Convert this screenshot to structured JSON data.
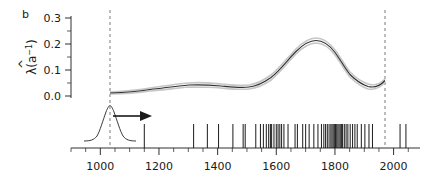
{
  "panel": {
    "label": "b"
  },
  "axes": {
    "y": {
      "label_main": "λ",
      "label_hat": "^",
      "label_paren_open": "(a",
      "label_sup": "−1",
      "label_paren_close": ")",
      "ticks": [
        "0.0",
        "0.1",
        "0.2",
        "0.3"
      ],
      "tick_values": [
        0.0,
        0.1,
        0.2,
        0.3
      ],
      "range": [
        0.0,
        0.32
      ]
    },
    "x": {
      "ticks": [
        "1000",
        "1200",
        "1400",
        "1600",
        "1800",
        "2000"
      ],
      "tick_values": [
        1000,
        1200,
        1400,
        1600,
        1800,
        2000
      ],
      "minor_step": 50,
      "range": [
        900,
        2090
      ]
    }
  },
  "markers": {
    "dashed_line_1": 1020,
    "dashed_line_2": 1999,
    "arrow_label": "time-direction-arrow",
    "bump_center": 1020,
    "bump_sd": 28
  },
  "chart_data": {
    "type": "line",
    "title": "",
    "xlabel": "",
    "ylabel": "λ̂(a⁻¹)",
    "xlim": [
      900,
      2090
    ],
    "ylim": [
      0.0,
      0.32
    ],
    "grid": false,
    "legend": "none",
    "series": [
      {
        "name": "estimate",
        "color": "#2b2b2b",
        "x": [
          1020,
          1060,
          1100,
          1140,
          1180,
          1220,
          1260,
          1300,
          1340,
          1380,
          1420,
          1460,
          1500,
          1540,
          1580,
          1620,
          1660,
          1700,
          1740,
          1780,
          1820,
          1860,
          1900,
          1940,
          1980,
          1999
        ],
        "y": [
          0.012,
          0.013,
          0.015,
          0.018,
          0.021,
          0.024,
          0.026,
          0.025,
          0.023,
          0.022,
          0.024,
          0.03,
          0.04,
          0.058,
          0.085,
          0.118,
          0.155,
          0.185,
          0.2,
          0.192,
          0.17,
          0.15,
          0.145,
          0.155,
          0.18,
          0.205
        ]
      },
      {
        "name": "upper-band",
        "color": "#c8c8c8",
        "x": [
          1020,
          1100,
          1180,
          1260,
          1340,
          1420,
          1500,
          1580,
          1660,
          1740,
          1820,
          1900,
          1980,
          1999
        ],
        "y": [
          0.016,
          0.019,
          0.025,
          0.03,
          0.027,
          0.028,
          0.046,
          0.092,
          0.165,
          0.212,
          0.182,
          0.152,
          0.186,
          0.212
        ]
      },
      {
        "name": "lower-band",
        "color": "#c8c8c8",
        "x": [
          1020,
          1100,
          1180,
          1260,
          1340,
          1420,
          1500,
          1580,
          1660,
          1740,
          1820,
          1900,
          1980,
          1999
        ],
        "y": [
          0.008,
          0.011,
          0.017,
          0.021,
          0.019,
          0.02,
          0.035,
          0.079,
          0.147,
          0.19,
          0.159,
          0.139,
          0.174,
          0.199
        ]
      }
    ],
    "peaks": [
      {
        "x": 1745,
        "y": 0.205
      },
      {
        "x": 1995,
        "y": 0.215
      }
    ],
    "rug": {
      "name": "event-rug",
      "values": [
        1150,
        1318,
        1365,
        1403,
        1452,
        1487,
        1494,
        1530,
        1546,
        1556,
        1566,
        1574,
        1580,
        1584,
        1592,
        1600,
        1606,
        1612,
        1618,
        1626,
        1640,
        1664,
        1672,
        1690,
        1700,
        1712,
        1728,
        1742,
        1754,
        1762,
        1768,
        1774,
        1780,
        1786,
        1790,
        1794,
        1798,
        1802,
        1806,
        1810,
        1814,
        1818,
        1822,
        1826,
        1832,
        1838,
        1844,
        1852,
        1860,
        1868,
        1876,
        1890,
        1902,
        1916,
        1928,
        2022,
        2042
      ]
    }
  }
}
